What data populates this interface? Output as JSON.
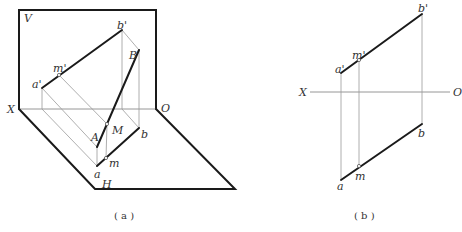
{
  "figure_a": {
    "caption": "( a )",
    "labels": {
      "V": "V",
      "H": "H",
      "X": "X",
      "O": "O",
      "a_prime": "a'",
      "m_prime": "m'",
      "b_prime": "b'",
      "A": "A",
      "B": "B",
      "M": "M",
      "a": "a",
      "m": "m",
      "b": "b"
    }
  },
  "figure_b": {
    "caption": "( b )",
    "labels": {
      "X": "X",
      "O": "O",
      "a_prime": "a'",
      "m_prime": "m'",
      "b_prime": "b'",
      "a": "a",
      "m": "m",
      "b": "b"
    }
  },
  "colors": {
    "thick_line": "#1a1a1a",
    "thin_line": "#9a9a9a",
    "text": "#333333",
    "background": "#ffffff"
  }
}
